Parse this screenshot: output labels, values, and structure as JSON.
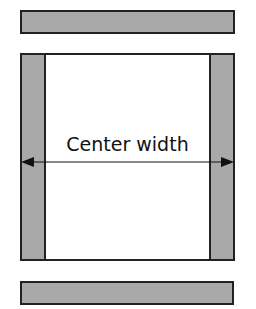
{
  "diagram": {
    "label": "Center width",
    "colors": {
      "panel_fill": "#a9a9a9",
      "border": "#222222",
      "center_fill": "#ffffff"
    }
  }
}
